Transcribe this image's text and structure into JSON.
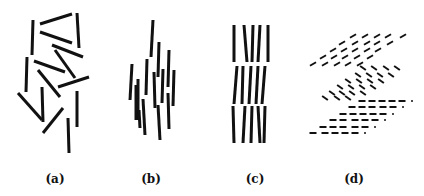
{
  "figure": {
    "width": 424,
    "height": 196,
    "stroke_color": "#111111",
    "background": "#ffffff"
  },
  "panels": [
    {
      "id": "a",
      "label": "(a)",
      "label_x": 55,
      "description": "isotropic: randomly oriented rods",
      "stroke_width": 3,
      "lines": [
        [
          33,
          20,
          32,
          55
        ],
        [
          40,
          24,
          72,
          14
        ],
        [
          77,
          13,
          79,
          48
        ],
        [
          40,
          32,
          72,
          43
        ],
        [
          52,
          45,
          83,
          57
        ],
        [
          55,
          50,
          75,
          78
        ],
        [
          27,
          57,
          26,
          92
        ],
        [
          34,
          61,
          65,
          72
        ],
        [
          38,
          70,
          60,
          97
        ],
        [
          58,
          87,
          89,
          77
        ],
        [
          42,
          87,
          43,
          122
        ],
        [
          18,
          93,
          42,
          120
        ],
        [
          43,
          133,
          63,
          108
        ],
        [
          77,
          91,
          77,
          127
        ],
        [
          68,
          118,
          69,
          153
        ]
      ]
    },
    {
      "id": "b",
      "label": "(b)",
      "label_x": 151,
      "description": "nematic: rods aligned, positions random",
      "stroke_width": 3,
      "lines": [
        [
          153,
          20,
          151,
          57
        ],
        [
          159,
          42,
          158,
          77
        ],
        [
          169,
          50,
          168,
          87
        ],
        [
          132,
          64,
          130,
          100
        ],
        [
          147,
          59,
          146,
          95
        ],
        [
          138,
          79,
          138,
          120
        ],
        [
          136,
          85,
          136,
          120
        ],
        [
          143,
          99,
          145,
          135
        ],
        [
          154,
          72,
          155,
          108
        ],
        [
          163,
          69,
          162,
          103
        ],
        [
          174,
          70,
          173,
          106
        ],
        [
          158,
          105,
          160,
          140
        ],
        [
          168,
          93,
          169,
          129
        ],
        [
          139,
          110,
          140,
          128
        ]
      ]
    },
    {
      "id": "c",
      "label": "(c)",
      "label_x": 255,
      "description": "smectic A: aligned rods in layers",
      "stroke_width": 3,
      "lines": [
        [
          234,
          25,
          234,
          62
        ],
        [
          244,
          25,
          247,
          62
        ],
        [
          253,
          25,
          252,
          62
        ],
        [
          260,
          25,
          258,
          62
        ],
        [
          268,
          25,
          268,
          62
        ],
        [
          237,
          66,
          234,
          104
        ],
        [
          243,
          66,
          242,
          104
        ],
        [
          251,
          66,
          249,
          104
        ],
        [
          258,
          66,
          256,
          104
        ],
        [
          265,
          66,
          262,
          104
        ],
        [
          233,
          106,
          234,
          143
        ],
        [
          245,
          106,
          243,
          143
        ],
        [
          252,
          106,
          251,
          143
        ],
        [
          258,
          106,
          260,
          143
        ],
        [
          265,
          106,
          264,
          143
        ]
      ]
    },
    {
      "id": "d",
      "label": "(d)",
      "label_x": 354,
      "description": "layered structure with tilted and flat short rods",
      "stroke_width": 2,
      "dash_length": 7,
      "blocks": [
        {
          "name": "upper-block",
          "angle_deg": -30,
          "rows": [
            {
              "y": 36,
              "xs": [
                353,
                365,
                377,
                388,
                403
              ]
            },
            {
              "y": 43,
              "xs": [
                342,
                355,
                367,
                377,
                390
              ]
            },
            {
              "y": 50,
              "xs": [
                333,
                344,
                355,
                367,
                378
              ]
            },
            {
              "y": 57,
              "xs": [
                323,
                334,
                345,
                357,
                370
              ]
            },
            {
              "y": 64,
              "xs": [
                313,
                325,
                337,
                348,
                360
              ]
            }
          ]
        },
        {
          "name": "middle-block",
          "angle_deg": 35,
          "rows": [
            {
              "y": 68,
              "xs": [
                363,
                374,
                386,
                397
              ]
            },
            {
              "y": 75,
              "xs": [
                358,
                369,
                380,
                391
              ]
            },
            {
              "y": 81,
              "xs": [
                348,
                359,
                370,
                381
              ]
            },
            {
              "y": 87,
              "xs": [
                340,
                351,
                362,
                373
              ]
            },
            {
              "y": 93,
              "xs": [
                332,
                342,
                352,
                363
              ]
            },
            {
              "y": 98,
              "xs": [
                325,
                337,
                348
              ]
            }
          ]
        },
        {
          "name": "lower-block",
          "angle_deg": 0,
          "rows": [
            {
              "y": 101,
              "xs": [
                362,
                372,
                382,
                392,
                402
              ],
              "dot_x": 412
            },
            {
              "y": 107,
              "xs": [
                352,
                362,
                372,
                383,
                393
              ],
              "dot_x": 403
            },
            {
              "y": 114,
              "xs": [
                343,
                353,
                363,
                373,
                383
              ],
              "dot_x": 393
            },
            {
              "y": 120,
              "xs": [
                333,
                343,
                355,
                365,
                375
              ],
              "dot_x": 385
            },
            {
              "y": 127,
              "xs": [
                323,
                333,
                343,
                355,
                365
              ],
              "dot_x": 375
            },
            {
              "y": 133,
              "xs": [
                313,
                325,
                335,
                345,
                355
              ],
              "dot_x": 365
            }
          ]
        }
      ]
    }
  ]
}
